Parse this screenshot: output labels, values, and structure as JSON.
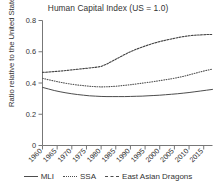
{
  "chart_data": {
    "type": "line",
    "title": "Human Capital Index (US = 1.0)",
    "xlabel": "",
    "ylabel": "Ratio relative to the United States",
    "xlim": [
      1960,
      2018
    ],
    "ylim": [
      0,
      0.8
    ],
    "grid": false,
    "legend_position": "bottom",
    "x_ticks": [
      "1960",
      "1965",
      "1970",
      "1975",
      "1980",
      "1985",
      "1990",
      "1995",
      "2000",
      "2005",
      "2010",
      "2015"
    ],
    "y_ticks": [
      "0",
      "0.2",
      "0.4",
      "0.6",
      "0.8"
    ],
    "x": [
      1960,
      1962,
      1964,
      1966,
      1968,
      1970,
      1972,
      1974,
      1976,
      1978,
      1980,
      1982,
      1984,
      1986,
      1988,
      1990,
      1992,
      1994,
      1996,
      1998,
      2000,
      2002,
      2004,
      2006,
      2008,
      2010,
      2012,
      2014,
      2016,
      2018
    ],
    "series": [
      {
        "name": "MLI",
        "style": "solid",
        "color": "#4d4d4d",
        "values": [
          0.372,
          0.362,
          0.352,
          0.344,
          0.337,
          0.331,
          0.326,
          0.322,
          0.318,
          0.316,
          0.314,
          0.313,
          0.313,
          0.313,
          0.313,
          0.314,
          0.315,
          0.316,
          0.318,
          0.32,
          0.322,
          0.325,
          0.328,
          0.331,
          0.335,
          0.339,
          0.344,
          0.349,
          0.354,
          0.359
        ]
      },
      {
        "name": "SSA",
        "style": "dotted",
        "color": "#555555",
        "values": [
          0.43,
          0.421,
          0.413,
          0.405,
          0.398,
          0.392,
          0.387,
          0.383,
          0.379,
          0.377,
          0.375,
          0.376,
          0.378,
          0.381,
          0.385,
          0.389,
          0.394,
          0.399,
          0.404,
          0.409,
          0.415,
          0.421,
          0.427,
          0.434,
          0.442,
          0.452,
          0.462,
          0.472,
          0.481,
          0.489
        ]
      },
      {
        "name": "East Asian Dragons",
        "style": "dashed",
        "color": "#444444",
        "values": [
          0.468,
          0.47,
          0.473,
          0.476,
          0.48,
          0.484,
          0.488,
          0.492,
          0.496,
          0.5,
          0.506,
          0.522,
          0.542,
          0.562,
          0.582,
          0.6,
          0.616,
          0.63,
          0.643,
          0.655,
          0.665,
          0.674,
          0.682,
          0.69,
          0.697,
          0.702,
          0.706,
          0.708,
          0.71,
          0.711
        ]
      }
    ]
  },
  "legend": {
    "items": [
      {
        "label": "MLI",
        "swatch": "line-solid-swatch"
      },
      {
        "label": "SSA",
        "swatch": "line-dotted-swatch"
      },
      {
        "label": "East Asian Dragons",
        "swatch": "line-dashed-swatch"
      }
    ]
  }
}
